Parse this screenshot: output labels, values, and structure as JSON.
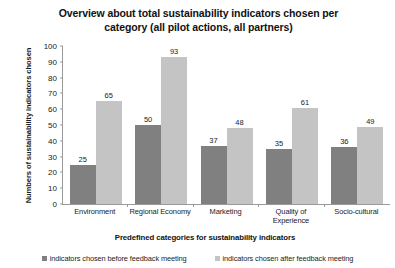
{
  "chart_data": {
    "type": "bar",
    "title": "Overview about total sustainability indicators chosen per category (all pilot actions, all partners)",
    "title_line1": "Overview about total sustainability indicators chosen per",
    "title_line2": "category (all pilot actions, all partners)",
    "xlabel": "Predefined categories for sustainability indicators",
    "ylabel": "Numbers of sustainability indicators chosen",
    "categories": [
      "Environment",
      "Regional Economy",
      "Marketing",
      "Quality of Experience",
      "Socio-cultural"
    ],
    "category_lines": [
      [
        "Environment"
      ],
      [
        "Regional Economy"
      ],
      [
        "Marketing"
      ],
      [
        "Quality of",
        "Experience"
      ],
      [
        "Socio-cultural"
      ]
    ],
    "series": [
      {
        "name": "indicators chosen before feedback meeting",
        "color": "#808080",
        "values": [
          25,
          50,
          37,
          35,
          36
        ]
      },
      {
        "name": "indicators chosen after feedback meeting",
        "color": "#c4c4c4",
        "values": [
          65,
          93,
          48,
          61,
          49
        ]
      }
    ],
    "ylim": [
      0,
      100
    ],
    "yticks": [
      100,
      90,
      80,
      70,
      60,
      50,
      40,
      30,
      20,
      10,
      0
    ],
    "ytick_labels": [
      "100",
      "90",
      "80",
      "70",
      "60",
      "50",
      "40",
      "30",
      "20",
      "10",
      "0"
    ],
    "grid": false,
    "legend_position": "bottom",
    "data_labels": true
  }
}
